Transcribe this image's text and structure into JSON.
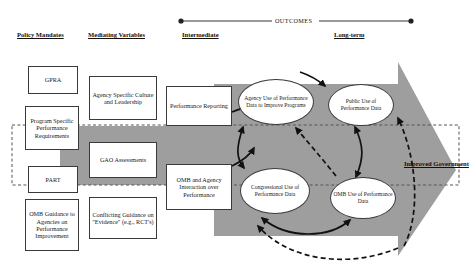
{
  "diagram": {
    "title_band": {
      "outcomes_label": "OUTCOMES"
    },
    "column_headers": [
      {
        "id": "policy-mandates",
        "label": "Policy Mandates"
      },
      {
        "id": "mediating-variables",
        "label": "Mediating Variables"
      },
      {
        "id": "intermediate",
        "label": "Intermediate"
      },
      {
        "id": "long-term",
        "label": "Long-term"
      }
    ],
    "policy_mandates": [
      {
        "id": "gpra",
        "label": "GPRA"
      },
      {
        "id": "program-specific-performance-requirements",
        "label": "Program Specific Performance Requirements"
      },
      {
        "id": "part",
        "label": "PART"
      },
      {
        "id": "omb-guidance",
        "label": "OMB Guidance to Agencies on Performance Improvement"
      }
    ],
    "mediating_variables": [
      {
        "id": "agency-specific-culture-and-leadership",
        "label": "Agency Specific Culture and Leadership"
      },
      {
        "id": "gao-assessments",
        "label": "GAO Assessments"
      },
      {
        "id": "conflicting-guidance-on-evidence",
        "label": "Conflicting Guidance on \"Evidence\" (e.g., RCT's)"
      }
    ],
    "intermediate_boxes": [
      {
        "id": "performance-reporting",
        "label": "Performance Reporting"
      },
      {
        "id": "omb-and-agency-interaction-over-performance",
        "label": "OMB and Agency Interaction over Performance"
      }
    ],
    "outcome_ellipses": [
      {
        "id": "agency-use-of-performance-data",
        "label": "Agency Use of Performance Data to Improve Programs"
      },
      {
        "id": "public-use-of-performance-data",
        "label": "Public Use of Performance Data"
      },
      {
        "id": "congressional-use-of-performance-data",
        "label": "Congressional Use of Performance Data"
      },
      {
        "id": "omb-use-of-performance-data",
        "label": "OMB Use of Performance Data"
      }
    ],
    "terminal_label": "Improved Government",
    "colors": {
      "band_gray": "#9e9e9e",
      "outline": "#3a3a3a",
      "text": "#1a1a1a",
      "page_background": "#ffffff"
    }
  }
}
